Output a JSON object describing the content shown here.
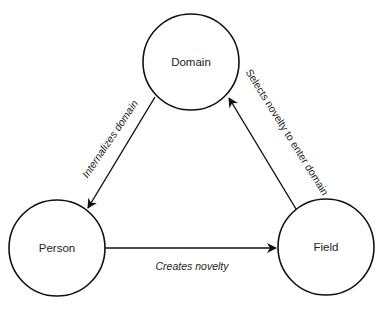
{
  "diagram": {
    "nodes": [
      {
        "id": "domain",
        "label": "Domain"
      },
      {
        "id": "person",
        "label": "Person"
      },
      {
        "id": "field",
        "label": "Field"
      }
    ],
    "edges": [
      {
        "from": "domain",
        "to": "person",
        "label": "Internalizes domain"
      },
      {
        "from": "person",
        "to": "field",
        "label": "Creates novelty"
      },
      {
        "from": "field",
        "to": "domain",
        "label": "Selects novelty to enter domain"
      }
    ],
    "colors": {
      "stroke": "#111111",
      "text": "#222222",
      "background": "#ffffff"
    }
  }
}
